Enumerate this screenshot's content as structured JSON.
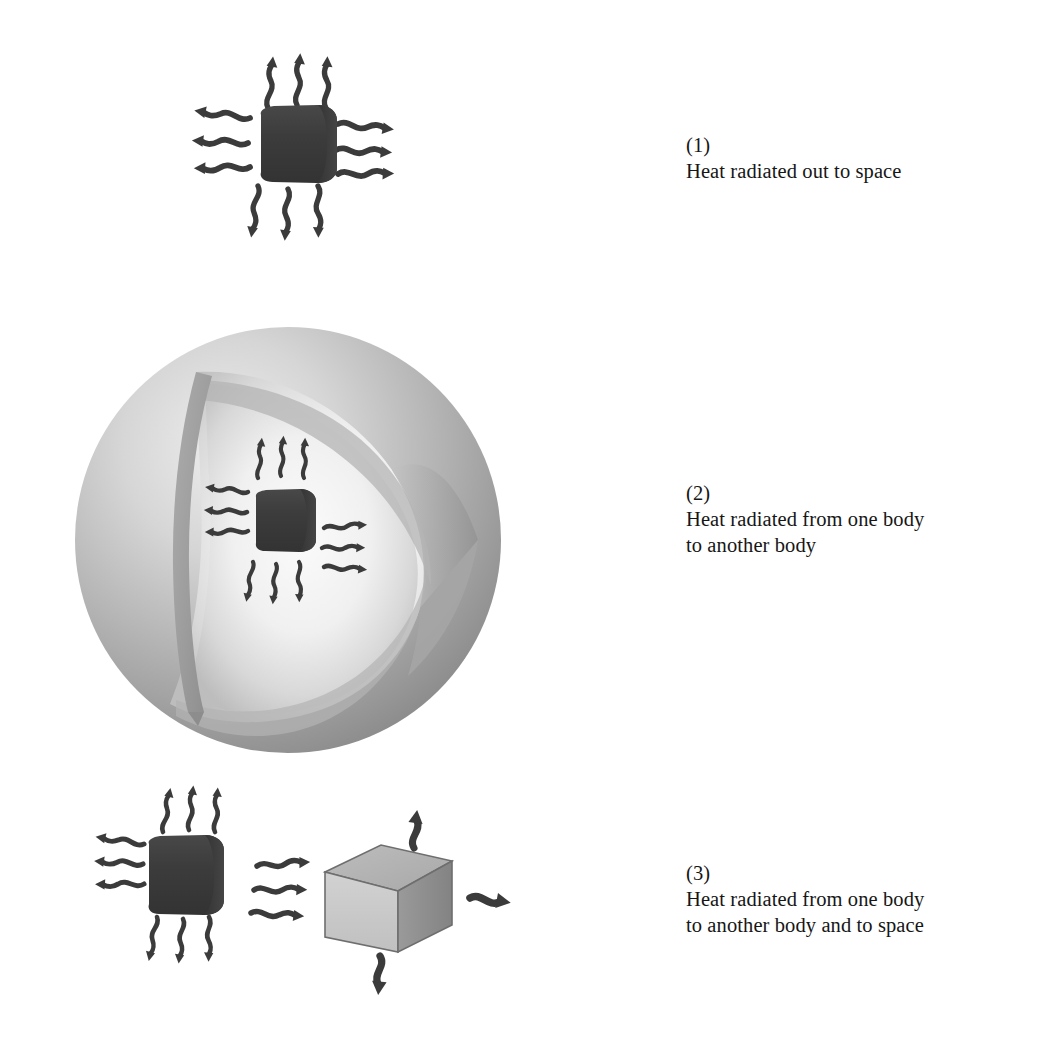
{
  "page": {
    "background_color": "#ffffff",
    "width": 1043,
    "height": 1045
  },
  "palette": {
    "body_dark": "#3c3c3c",
    "arrow_dark": "#3b3b3b",
    "sphere_light": "#e6e6e6",
    "sphere_mid": "#b9b9b9",
    "sphere_dark": "#8f8f8f",
    "sphere_cut_edge": "#9a9a9a",
    "sphere_cavity": "#f2f2f2",
    "box_top": "#b4b4b4",
    "box_front": "#c9c9c9",
    "box_side": "#8d8d8d",
    "box_outline": "#6e6e6e",
    "text": "#161616"
  },
  "figures": [
    {
      "id": "figure-1",
      "number": "(1)",
      "caption_lines": [
        "Heat radiated out to space"
      ],
      "objects": [
        {
          "name": "radiating-cylinder",
          "kind": "cylinder",
          "fill": "#3c3c3c"
        }
      ],
      "arrow_groups": [
        {
          "direction": "up",
          "count": 3
        },
        {
          "direction": "left",
          "count": 3
        },
        {
          "direction": "right",
          "count": 3
        },
        {
          "direction": "down",
          "count": 3
        }
      ]
    },
    {
      "id": "figure-2",
      "number": "(2)",
      "caption_lines": [
        "Heat radiated from one body",
        "to another body"
      ],
      "objects": [
        {
          "name": "enclosing-sphere",
          "kind": "cutaway-sphere",
          "fill": "#b9b9b9"
        },
        {
          "name": "radiating-cylinder",
          "kind": "cylinder",
          "fill": "#3c3c3c"
        }
      ],
      "arrow_groups": [
        {
          "direction": "up",
          "count": 3
        },
        {
          "direction": "left",
          "count": 3
        },
        {
          "direction": "right",
          "count": 3
        },
        {
          "direction": "down",
          "count": 3
        }
      ]
    },
    {
      "id": "figure-3",
      "number": "(3)",
      "caption_lines": [
        "Heat radiated from one body",
        "to another body and to space"
      ],
      "objects": [
        {
          "name": "radiating-cylinder",
          "kind": "cylinder",
          "fill": "#3c3c3c"
        },
        {
          "name": "receiving-box",
          "kind": "cube",
          "fill": "#c9c9c9"
        }
      ],
      "arrow_groups": [
        {
          "direction": "up",
          "count": 3
        },
        {
          "direction": "left",
          "count": 3
        },
        {
          "direction": "right",
          "count": 3
        },
        {
          "direction": "down",
          "count": 3
        },
        {
          "direction": "box-up",
          "count": 1
        },
        {
          "direction": "box-right",
          "count": 1
        },
        {
          "direction": "box-down",
          "count": 1
        }
      ]
    }
  ],
  "captions": {
    "c1": {
      "num": "(1)",
      "line1": "Heat radiated out to space",
      "line2": ""
    },
    "c2": {
      "num": "(2)",
      "line1": "Heat radiated from one body",
      "line2": "to another body"
    },
    "c3": {
      "num": "(3)",
      "line1": "Heat radiated from one body",
      "line2": "to another body and to space"
    }
  }
}
